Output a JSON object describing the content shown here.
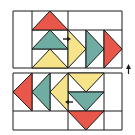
{
  "diagram": {
    "colors": {
      "red": "#e8574a",
      "teal": "#6fada3",
      "yellow": "#f7e48a",
      "outline": "#1a1a1a",
      "background": "#ffffff"
    },
    "top_block": {
      "rows": [
        {
          "color": "red",
          "direction": "up"
        },
        {
          "color": "teal",
          "direction": "up"
        },
        {
          "color": "yellow",
          "direction": "up"
        }
      ],
      "columns": [
        {
          "color": "yellow",
          "direction": "right"
        },
        {
          "color": "teal",
          "direction": "right"
        },
        {
          "color": "red",
          "direction": "right"
        }
      ],
      "arrow": "right"
    },
    "bottom_block": {
      "columns": [
        {
          "color": "red",
          "direction": "left"
        },
        {
          "color": "teal",
          "direction": "left"
        },
        {
          "color": "yellow",
          "direction": "left"
        }
      ],
      "rows": [
        {
          "color": "yellow",
          "direction": "down"
        },
        {
          "color": "teal",
          "direction": "down"
        },
        {
          "color": "red",
          "direction": "down"
        }
      ],
      "arrow": "left"
    },
    "side_arrow": "up"
  }
}
